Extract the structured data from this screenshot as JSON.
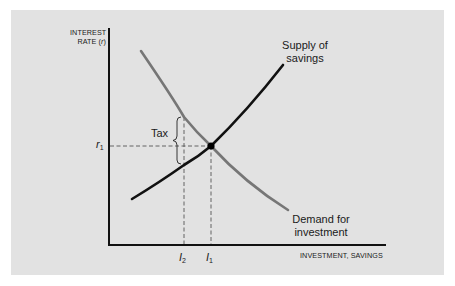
{
  "diagram": {
    "type": "supply-demand",
    "title": "",
    "y_axis": {
      "label_line1": "INTEREST",
      "label_line2": "RATE (",
      "label_var": "r",
      "label_close": ")"
    },
    "x_axis": {
      "label": "INVESTMENT, SAVINGS"
    },
    "curves": {
      "supply": {
        "label_line1": "Supply of",
        "label_line2": "savings",
        "color": "#111111"
      },
      "demand": {
        "label_line1": "Demand for",
        "label_line2": "investment",
        "color": "#767676"
      }
    },
    "annotations": {
      "tax_label": "Tax",
      "r1_var": "r",
      "r1_sub": "1",
      "i1_var": "I",
      "i1_sub": "1",
      "i2_var": "I",
      "i2_sub": "2"
    },
    "colors": {
      "panel_background": "#e2e2e2",
      "page_background": "#ffffff",
      "axis": "#111111",
      "dashed_guides": "#555555"
    }
  }
}
